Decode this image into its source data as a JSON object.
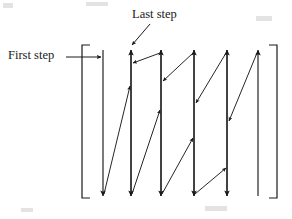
{
  "figure": {
    "name": "raster-scan-path-diagram",
    "stroke_color": "#1a1a1a",
    "background_color": "#ffffff",
    "line_width": 1.1,
    "canvas": {
      "width": 292,
      "height": 219
    }
  },
  "labels": {
    "last_step": "Last step",
    "first_step": "First step"
  },
  "brackets": {
    "left": {
      "x": 82,
      "top": 45,
      "bottom": 198,
      "tick": 8
    },
    "right": {
      "x": 277,
      "top": 45,
      "bottom": 198,
      "tick": 8
    }
  },
  "geometry": {
    "top_y": 48,
    "bottom_y": 196,
    "columns": [
      {
        "id": "col-1",
        "x": 103,
        "direction": "down",
        "y_start": 50,
        "y_end": 196
      },
      {
        "id": "col-2",
        "x": 131,
        "direction": "up",
        "y_start": 196,
        "y_end": 50
      },
      {
        "id": "col-3",
        "x": 161,
        "direction": "down",
        "y_start": 50,
        "y_end": 196
      },
      {
        "id": "col-4",
        "x": 194,
        "direction": "up",
        "y_start": 196,
        "y_end": 50
      },
      {
        "id": "col-5",
        "x": 227,
        "direction": "down",
        "y_start": 50,
        "y_end": 196
      },
      {
        "id": "col-6",
        "x": 258,
        "direction": "up",
        "y_start": 196,
        "y_end": 50
      }
    ],
    "connectors": [
      {
        "id": "conn-1",
        "x1": 103,
        "y1": 196,
        "x2": 131,
        "y2": 84,
        "direction": "up-right"
      },
      {
        "id": "conn-2",
        "x1": 131,
        "y1": 196,
        "x2": 161,
        "y2": 108,
        "direction": "up-right"
      },
      {
        "id": "conn-3",
        "x1": 161,
        "y1": 196,
        "x2": 194,
        "y2": 136,
        "direction": "up-right"
      },
      {
        "id": "conn-4",
        "x1": 194,
        "y1": 196,
        "x2": 227,
        "y2": 166,
        "direction": "up-right"
      },
      {
        "id": "conn-5",
        "x1": 161,
        "y1": 52,
        "x2": 131,
        "y2": 62,
        "direction": "down-left"
      },
      {
        "id": "conn-6",
        "x1": 194,
        "y1": 52,
        "x2": 161,
        "y2": 80,
        "direction": "down-left"
      },
      {
        "id": "conn-7",
        "x1": 227,
        "y1": 52,
        "x2": 194,
        "y2": 102,
        "direction": "down-left"
      },
      {
        "id": "conn-8",
        "x1": 258,
        "y1": 52,
        "x2": 227,
        "y2": 120,
        "direction": "down-left"
      }
    ],
    "callouts": [
      {
        "id": "first-step-callout",
        "x1": 66,
        "y1": 57,
        "x2": 100,
        "y2": 57,
        "direction": "right"
      },
      {
        "id": "last-step-callout",
        "x1": 150,
        "y1": 24,
        "x2": 132,
        "y2": 45,
        "direction": "down-left"
      }
    ]
  },
  "chart_data": {
    "type": "diagram",
    "title": "",
    "xlabel": "",
    "ylabel": "",
    "annotations": [
      "First step",
      "Last step"
    ],
    "series": [
      {
        "name": "scan-columns",
        "values": [
          {
            "column": 1,
            "x": 103,
            "direction": "down"
          },
          {
            "column": 2,
            "x": 131,
            "direction": "up"
          },
          {
            "column": 3,
            "x": 161,
            "direction": "down"
          },
          {
            "column": 4,
            "x": 194,
            "direction": "up"
          },
          {
            "column": 5,
            "x": 227,
            "direction": "down"
          },
          {
            "column": 6,
            "x": 258,
            "direction": "up"
          }
        ]
      }
    ]
  },
  "artifacts": [
    {
      "left": 3,
      "top": 3,
      "width": 10,
      "height": 5
    },
    {
      "left": 86,
      "top": 2,
      "width": 22,
      "height": 4
    },
    {
      "left": 256,
      "top": 16,
      "width": 16,
      "height": 5
    },
    {
      "left": 205,
      "top": 206,
      "width": 22,
      "height": 5
    },
    {
      "left": 21,
      "top": 208,
      "width": 12,
      "height": 4
    }
  ]
}
